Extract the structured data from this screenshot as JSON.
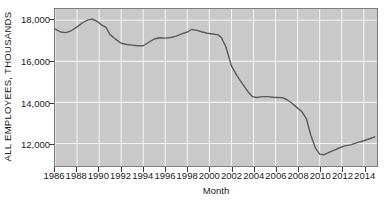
{
  "chart_data": {
    "type": "line",
    "title": "",
    "xlabel": "Month",
    "ylabel": "ALL EMPLOYEES, THOUSANDS",
    "xlim": [
      1986,
      2015.2
    ],
    "ylim": [
      10900,
      18550
    ],
    "grid": true,
    "legend": null,
    "xticks": [
      "1986",
      "1988",
      "1990",
      "1992",
      "1994",
      "1996",
      "1998",
      "2000",
      "2002",
      "2004",
      "2006",
      "2008",
      "2010",
      "2012",
      "2014"
    ],
    "xtick_values": [
      1986,
      1988,
      1990,
      1992,
      1994,
      1996,
      1998,
      2000,
      2002,
      2004,
      2006,
      2008,
      2010,
      2012,
      2014
    ],
    "yticks": [
      "12,000",
      "14,000",
      "16,000",
      "18,000"
    ],
    "ytick_values": [
      12000,
      14000,
      16000,
      18000
    ],
    "series": [
      {
        "name": "All Employees, Manufacturing",
        "color": "#5a5a5a",
        "x": [
          1986.0,
          1986.5,
          1987.0,
          1987.5,
          1988.0,
          1988.5,
          1989.0,
          1989.4,
          1989.8,
          1990.2,
          1990.6,
          1991.0,
          1991.5,
          1992.0,
          1992.5,
          1993.0,
          1993.5,
          1994.0,
          1994.5,
          1995.0,
          1995.5,
          1996.0,
          1996.5,
          1997.0,
          1997.5,
          1998.0,
          1998.4,
          1998.8,
          1999.3,
          1999.8,
          2000.3,
          2000.8,
          2001.1,
          2001.5,
          2002.0,
          2002.5,
          2003.0,
          2003.5,
          2003.9,
          2004.3,
          2004.8,
          2005.3,
          2005.8,
          2006.2,
          2006.6,
          2007.0,
          2007.5,
          2008.0,
          2008.4,
          2008.8,
          2009.2,
          2009.6,
          2010.0,
          2010.4,
          2011.0,
          2011.6,
          2012.2,
          2012.8,
          2013.4,
          2014.0,
          2014.6,
          2015.0
        ],
        "y": [
          17580,
          17430,
          17400,
          17500,
          17680,
          17880,
          18020,
          18050,
          17960,
          17780,
          17670,
          17300,
          17080,
          16880,
          16820,
          16790,
          16760,
          16760,
          16930,
          17090,
          17150,
          17130,
          17160,
          17230,
          17340,
          17430,
          17550,
          17520,
          17440,
          17370,
          17330,
          17290,
          17150,
          16700,
          15780,
          15300,
          14900,
          14520,
          14280,
          14240,
          14280,
          14280,
          14250,
          14240,
          14230,
          14140,
          13960,
          13720,
          13540,
          13200,
          12400,
          11800,
          11480,
          11450,
          11600,
          11740,
          11870,
          11930,
          12040,
          12130,
          12240,
          12320
        ]
      }
    ]
  },
  "axes": {
    "y_title": "ALL EMPLOYEES, THOUSANDS",
    "x_title": "Month"
  }
}
